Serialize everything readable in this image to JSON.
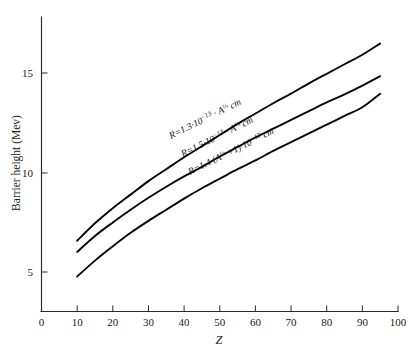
{
  "figure": {
    "name": "barrier-height-vs-atomic-number",
    "background_color": "#ffffff",
    "ink_color": "#111111"
  },
  "chart_data": {
    "type": "line",
    "title": "",
    "subtitle": "",
    "xlabel": "Z",
    "ylabel": "Barrier height (Mev)",
    "xlim": [
      0,
      100
    ],
    "ylim": [
      0,
      18.3
    ],
    "grid": false,
    "legend_position": "inline-curve-labels",
    "xticks": [
      0,
      10,
      20,
      30,
      40,
      50,
      60,
      70,
      80,
      90,
      100
    ],
    "xticklabels": [
      "0",
      "10",
      "20",
      "30",
      "40",
      "50",
      "60",
      "70",
      "80",
      "90",
      "100"
    ],
    "yticks": [
      5,
      10,
      15
    ],
    "yticklabels": [
      "5",
      "10",
      "15"
    ],
    "x": [
      10,
      15,
      20,
      25,
      30,
      35,
      40,
      45,
      50,
      55,
      60,
      65,
      70,
      75,
      80,
      85,
      90,
      95
    ],
    "series": [
      {
        "name": "R = 1.3e-13 A^(1/3) cm",
        "label_text": "R=1.3·10⁻¹³ · A⅓ cm",
        "label_parts": {
          "lead": "R=1.3·10",
          "exp": "−13",
          "mid": " · A",
          "frac": "⅓",
          "tail": " cm"
        },
        "values": [
          4.45,
          5.55,
          6.5,
          7.35,
          8.2,
          8.95,
          9.7,
          10.4,
          11.1,
          11.8,
          12.45,
          13.1,
          13.7,
          14.35,
          14.95,
          15.55,
          16.15,
          16.85
        ]
      },
      {
        "name": "R = 1.5e-13 A^(1/3) cm",
        "label_text": "R=1.5·10⁻¹³ · A⅓ cm",
        "label_parts": {
          "lead": "R=1.5·10",
          "exp": "−13",
          "mid": " · A",
          "frac": "⅓",
          "tail": " cm"
        },
        "values": [
          3.75,
          4.75,
          5.6,
          6.4,
          7.15,
          7.85,
          8.5,
          9.1,
          9.75,
          10.35,
          10.95,
          11.5,
          12.05,
          12.6,
          13.15,
          13.65,
          14.2,
          14.8
        ]
      },
      {
        "name": "R = 1.4 (A^(1/3) + 1) e-13 cm",
        "label_text": "R=1.4 (A⅓ + 1)·10⁻¹³ cm",
        "label_parts": {
          "lead": "R=1.4 (A",
          "frac": "⅓",
          "mid": " +1)·10",
          "exp": "−13",
          "tail": " cm"
        },
        "values": [
          2.2,
          3.2,
          4.1,
          4.95,
          5.7,
          6.4,
          7.1,
          7.75,
          8.35,
          8.95,
          9.5,
          10.1,
          10.65,
          11.2,
          11.75,
          12.3,
          12.85,
          13.7
        ]
      }
    ]
  },
  "axes": {
    "x_axis_name": "x-axis",
    "y_axis_name": "y-axis"
  }
}
